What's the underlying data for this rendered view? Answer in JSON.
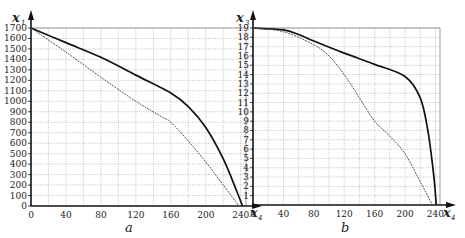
{
  "chart_data": [
    {
      "type": "line",
      "panel_label": "a",
      "xlabel": "x4",
      "ylabel": "x1",
      "xlim": [
        0,
        246
      ],
      "ylim": [
        0,
        1700
      ],
      "x_ticks": [
        0,
        40,
        80,
        120,
        160,
        200,
        240
      ],
      "y_ticks": [
        0,
        100,
        200,
        300,
        400,
        500,
        600,
        700,
        800,
        900,
        1000,
        1100,
        1200,
        1300,
        1400,
        1500,
        1600,
        1700
      ],
      "grid": true,
      "series": [
        {
          "name": "solid",
          "style": "solid",
          "x": [
            0,
            40,
            80,
            120,
            160,
            180,
            200,
            220,
            235,
            242
          ],
          "y": [
            1700,
            1560,
            1420,
            1250,
            1080,
            950,
            750,
            450,
            150,
            0
          ]
        },
        {
          "name": "dashed",
          "style": "dashed",
          "x": [
            0,
            40,
            80,
            120,
            150,
            160,
            180,
            200,
            220,
            238
          ],
          "y": [
            1700,
            1470,
            1230,
            1000,
            850,
            800,
            620,
            420,
            200,
            0
          ]
        }
      ]
    },
    {
      "type": "line",
      "panel_label": "b",
      "xlabel": "x4",
      "ylabel": "x3",
      "xlim": [
        0,
        246
      ],
      "ylim": [
        0,
        19
      ],
      "x_ticks": [
        0,
        40,
        80,
        120,
        160,
        200,
        240
      ],
      "y_ticks": [
        1,
        2,
        3,
        4,
        5,
        6,
        7,
        8,
        9,
        10,
        11,
        12,
        13,
        14,
        15,
        16,
        17,
        18,
        19
      ],
      "grid": true,
      "series": [
        {
          "name": "solid",
          "style": "solid",
          "x": [
            0,
            40,
            60,
            80,
            120,
            160,
            200,
            220,
            230,
            238,
            241
          ],
          "y": [
            19,
            18.8,
            18.3,
            17.6,
            16.3,
            15.1,
            13.8,
            11.5,
            8,
            3,
            0
          ]
        },
        {
          "name": "dashed",
          "style": "dashed",
          "x": [
            0,
            40,
            80,
            100,
            120,
            140,
            160,
            180,
            200,
            220,
            236
          ],
          "y": [
            19,
            18.6,
            17.2,
            16,
            14,
            11.5,
            9,
            7.4,
            5.5,
            2.5,
            0
          ]
        }
      ]
    }
  ],
  "labels": {
    "a": {
      "y_main": "x",
      "y_sub": "1",
      "x_main": "x",
      "x_sub": "4",
      "panel": "a"
    },
    "b": {
      "y_main": "x",
      "y_sub": "3",
      "x_main": "x",
      "x_sub": "4",
      "panel": "b"
    }
  }
}
